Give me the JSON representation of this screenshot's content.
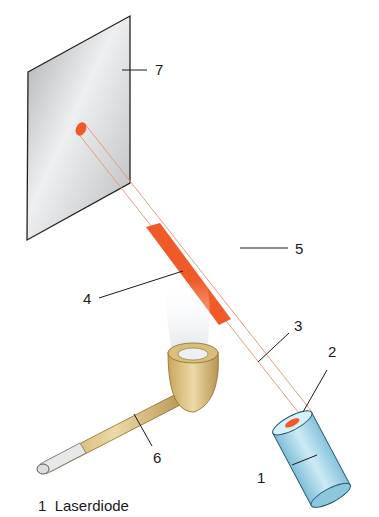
{
  "diagram": {
    "colors": {
      "beam": "#f05a28",
      "beam_outline": "#e89a80",
      "screen": "#c9cacc",
      "diode": "#a8d8ea",
      "pipe": "#d9bd7a",
      "smoke": "#e4e8ec"
    },
    "labels": {
      "l1": "1",
      "l2": "2",
      "l3": "3",
      "l4": "4",
      "l5": "5",
      "l6": "6",
      "l7": "7"
    },
    "components": [
      {
        "number": "1",
        "name": "laser-diode"
      },
      {
        "number": "2",
        "name": "laser-aperture"
      },
      {
        "number": "3",
        "name": "laser-beam-invisible"
      },
      {
        "number": "4",
        "name": "laser-beam-visible-in-smoke"
      },
      {
        "number": "5",
        "name": "air"
      },
      {
        "number": "6",
        "name": "pipe"
      },
      {
        "number": "7",
        "name": "screen"
      }
    ],
    "legend": {
      "number": "1",
      "text": "Laserdiode"
    }
  }
}
